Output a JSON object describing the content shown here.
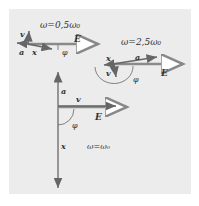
{
  "diagram": {
    "background": "#ececec",
    "colors": {
      "field": "#8a8a8a",
      "vector": "#6e6e6e",
      "text": "#333333"
    },
    "diagrams": [
      {
        "id": "low",
        "omega_label": "ω = 0,5 ω₀",
        "vectors": [
          "v",
          "E",
          "a",
          "x"
        ],
        "angle": "φ"
      },
      {
        "id": "high",
        "omega_label": "ω = 2,5 ω₀",
        "vectors": [
          "x",
          "a",
          "v",
          "E"
        ],
        "angle": "φ"
      },
      {
        "id": "resonance",
        "omega_label": "ω = ω₀",
        "vectors": [
          "a",
          "v",
          "E",
          "x"
        ],
        "angle": "φ"
      }
    ],
    "labels": {
      "low_omega": "ω=0,5ω₀",
      "high_omega": "ω=2,5ω₀",
      "res_omega": "ω=ω₀",
      "v": "v",
      "E": "E",
      "a": "a",
      "x": "x",
      "phi": "φ"
    }
  }
}
